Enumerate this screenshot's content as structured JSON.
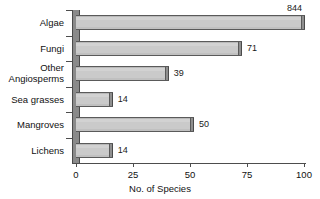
{
  "chart_data": {
    "type": "bar",
    "orientation": "horizontal",
    "title": "",
    "xlabel": "No. of Species",
    "ylabel": "",
    "xlim": [
      0,
      100
    ],
    "xticks": [
      0,
      25,
      50,
      75,
      100
    ],
    "grid": false,
    "legend": null,
    "categories": [
      "Algae",
      "Fungi",
      "Other Angiosperms",
      "Sea grasses",
      "Mangroves",
      "Lichens"
    ],
    "values": [
      844,
      71,
      39,
      14,
      50,
      14
    ],
    "value_labels": [
      "844",
      "71",
      "39",
      "14",
      "50",
      "14"
    ]
  },
  "axis": {
    "x_tick_labels": [
      "0",
      "25",
      "50",
      "75",
      "100"
    ],
    "x_title": "No. of Species"
  },
  "categories": [
    {
      "label": "Algae",
      "line1": "Algae",
      "line2": "",
      "value": 844,
      "value_label": "844",
      "bar_units": 101.2,
      "label_placement": "above"
    },
    {
      "label": "Fungi",
      "line1": "Fungi",
      "line2": "",
      "value": 71,
      "value_label": "71",
      "bar_units": 72.5,
      "label_placement": "side"
    },
    {
      "label": "Other Angiosperms",
      "line1": "Other",
      "line2": "Angiosperms",
      "value": 39,
      "value_label": "39",
      "bar_units": 40.5,
      "label_placement": "side"
    },
    {
      "label": "Sea grasses",
      "line1": "Sea grasses",
      "line2": "",
      "value": 14,
      "value_label": "14",
      "bar_units": 16.0,
      "label_placement": "side"
    },
    {
      "label": "Mangroves",
      "line1": "Mangroves",
      "line2": "",
      "value": 50,
      "value_label": "50",
      "bar_units": 51.5,
      "label_placement": "side"
    },
    {
      "label": "Lichens",
      "line1": "Lichens",
      "line2": "",
      "value": 14,
      "value_label": "14",
      "bar_units": 16.0,
      "label_placement": "side"
    }
  ],
  "colors": {
    "bar_fill": "#cacaca",
    "bar_edge": "#5a5a5a",
    "bar_cap": "#8f8f8f",
    "axis": "#4d4d4d",
    "axis_band": "#8a8a8a",
    "text": "#111111",
    "background": "#ffffff"
  }
}
